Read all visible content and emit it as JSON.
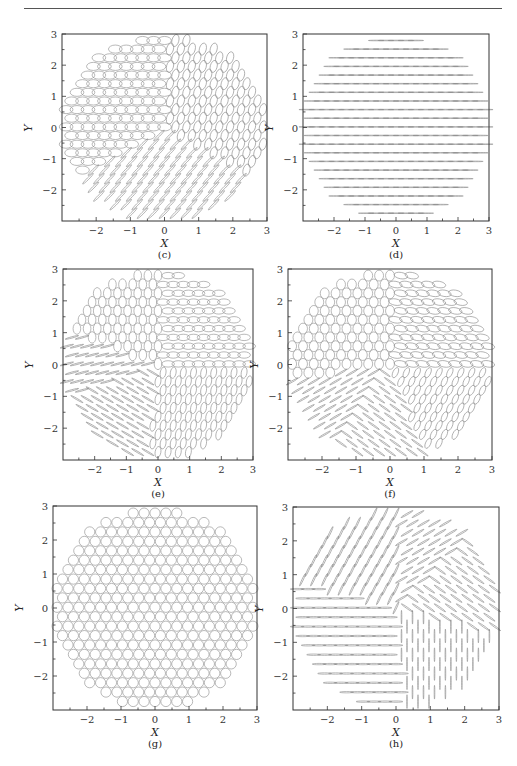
{
  "header": {
    "running_title": "",
    "page_number": ""
  },
  "chart_data": [
    {
      "id": "c",
      "type": "scatter",
      "caption": "(c)",
      "xlabel": "X",
      "ylabel": "Y",
      "xlim": [
        -3,
        3
      ],
      "ylim": [
        -3,
        3
      ],
      "xticks": [
        "-2",
        "-1",
        "0",
        "1",
        "2",
        "3"
      ],
      "yticks": [
        "-2",
        "-1",
        "0",
        "1",
        "2",
        "3"
      ],
      "glyph": "ellipse-field",
      "description": "Polarization ellipses on a circular hexagonal grid; upper-left sector horizontal ellipses, right sector tilted/vertical ellipses, lower-left sector thin lines at 45°",
      "frame": {
        "left": 62,
        "top": 34,
        "right": 267,
        "bottom": 221
      },
      "sectors": [
        {
          "from": 90,
          "to": 210,
          "angle": 0,
          "rx": 0.2,
          "ry": 0.13
        },
        {
          "from": 210,
          "to": 330,
          "angle": 45,
          "rx": 0.22,
          "ry": 0.03
        },
        {
          "from": -30,
          "to": 90,
          "angle": 75,
          "rx": 0.18,
          "ry": 0.11
        }
      ]
    },
    {
      "id": "d",
      "type": "scatter",
      "caption": "(d)",
      "xlabel": "X",
      "ylabel": "Y",
      "xlim": [
        -3,
        3
      ],
      "ylim": [
        -3,
        3
      ],
      "xticks": [
        "-2",
        "-1",
        "0",
        "1",
        "2",
        "3"
      ],
      "yticks": [
        "-2",
        "-1",
        "0",
        "1",
        "2",
        "3"
      ],
      "glyph": "ellipse-field",
      "description": "Uniform horizontal linear polarization lines across circular aperture",
      "frame": {
        "left": 303,
        "top": 34,
        "right": 489,
        "bottom": 221
      },
      "sectors": [
        {
          "from": 0,
          "to": 360,
          "angle": 0,
          "rx": 0.25,
          "ry": 0.0
        }
      ]
    },
    {
      "id": "e",
      "type": "scatter",
      "caption": "(e)",
      "xlabel": "X",
      "ylabel": "Y",
      "xlim": [
        -3,
        3
      ],
      "ylim": [
        -3,
        3
      ],
      "xticks": [
        "-2",
        "-1",
        "0",
        "1",
        "2",
        "3"
      ],
      "yticks": [
        "-2",
        "-1",
        "0",
        "1",
        "2",
        "3"
      ],
      "glyph": "ellipse-field",
      "description": "Four-sector pattern: upper-left vertical ellipses, upper-right horizontal ellipses, lower-left thin lines at ~20° and -30°, lower-right tilted vertical ellipses",
      "frame": {
        "left": 63,
        "top": 269,
        "right": 253,
        "bottom": 460
      },
      "sectors": [
        {
          "from": 90,
          "to": 160,
          "angle": 90,
          "rx": 0.18,
          "ry": 0.12
        },
        {
          "from": 0,
          "to": 90,
          "angle": 0,
          "rx": 0.2,
          "ry": 0.1
        },
        {
          "from": 160,
          "to": 200,
          "angle": 15,
          "rx": 0.22,
          "ry": 0.02
        },
        {
          "from": 200,
          "to": 265,
          "angle": -30,
          "rx": 0.22,
          "ry": 0.02
        },
        {
          "from": 265,
          "to": 360,
          "angle": 80,
          "rx": 0.18,
          "ry": 0.09
        }
      ]
    },
    {
      "id": "f",
      "type": "scatter",
      "caption": "(f)",
      "xlabel": "X",
      "ylabel": "Y",
      "xlim": [
        -3,
        3
      ],
      "ylim": [
        -3,
        3
      ],
      "xticks": [
        "-2",
        "-1",
        "0",
        "1",
        "2",
        "3"
      ],
      "yticks": [
        "-2",
        "-1",
        "0",
        "1",
        "2",
        "3"
      ],
      "glyph": "ellipse-field",
      "description": "Upper-left near-circular ellipses, upper-right horizontal tilted ellipses, lower-left thin lines at 30° and -30°, lower-right tilted ellipses",
      "frame": {
        "left": 288,
        "top": 269,
        "right": 492,
        "bottom": 460
      },
      "sectors": [
        {
          "from": 90,
          "to": 190,
          "angle": 90,
          "rx": 0.16,
          "ry": 0.14
        },
        {
          "from": 0,
          "to": 90,
          "angle": -10,
          "rx": 0.2,
          "ry": 0.1
        },
        {
          "from": 190,
          "to": 235,
          "angle": 30,
          "rx": 0.2,
          "ry": 0.02
        },
        {
          "from": 235,
          "to": 290,
          "angle": -35,
          "rx": 0.2,
          "ry": 0.02
        },
        {
          "from": 290,
          "to": 360,
          "angle": 65,
          "rx": 0.16,
          "ry": 0.08
        }
      ]
    },
    {
      "id": "g",
      "type": "scatter",
      "caption": "(g)",
      "xlabel": "X",
      "ylabel": "Y",
      "xlim": [
        -3,
        3
      ],
      "ylim": [
        -3,
        3
      ],
      "xticks": [
        "-2",
        "-1",
        "0",
        "1",
        "2",
        "3"
      ],
      "yticks": [
        "-2",
        "-1",
        "0",
        "1",
        "2",
        "3"
      ],
      "glyph": "ellipse-field",
      "description": "Uniform circular polarization: circles across full circular aperture",
      "frame": {
        "left": 53,
        "top": 506,
        "right": 257,
        "bottom": 710
      },
      "sectors": [
        {
          "from": 0,
          "to": 360,
          "angle": 0,
          "rx": 0.15,
          "ry": 0.15
        }
      ]
    },
    {
      "id": "h",
      "type": "scatter",
      "caption": "(h)",
      "xlabel": "X",
      "ylabel": "Y",
      "xlim": [
        -3,
        3
      ],
      "ylim": [
        -3,
        3
      ],
      "xticks": [
        "-2",
        "-1",
        "0",
        "1",
        "2",
        "3"
      ],
      "yticks": [
        "-2",
        "-1",
        "0",
        "1",
        "2",
        "3"
      ],
      "glyph": "ellipse-field",
      "description": "Linear polarization sectors: upper-left lines at ~65°, upper-right lines at 30° and -35°, lower-left horizontal lines, lower-right vertical lines",
      "frame": {
        "left": 293,
        "top": 507,
        "right": 499,
        "bottom": 710
      },
      "sectors": [
        {
          "from": 90,
          "to": 165,
          "angle": 65,
          "rx": 0.2,
          "ry": 0.02
        },
        {
          "from": 45,
          "to": 90,
          "angle": 30,
          "rx": 0.2,
          "ry": 0.02
        },
        {
          "from": -15,
          "to": 45,
          "angle": -35,
          "rx": 0.2,
          "ry": 0.02
        },
        {
          "from": 165,
          "to": 275,
          "angle": 0,
          "rx": 0.2,
          "ry": 0.02
        },
        {
          "from": 275,
          "to": 345,
          "angle": 90,
          "rx": 0.2,
          "ry": 0.01
        }
      ]
    }
  ]
}
